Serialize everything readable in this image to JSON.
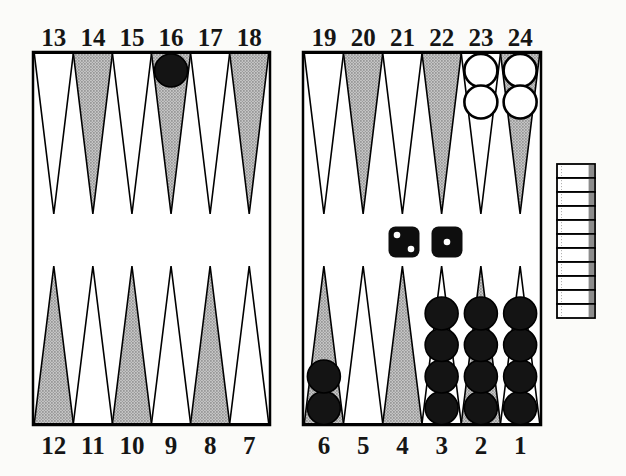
{
  "diagram": {
    "type": "backgammon-position"
  },
  "colors": {
    "background": "#fbfbf9",
    "board_fill": "#ffffff",
    "outline": "#000000",
    "point_shaded": "#bdbdbd",
    "point_shaded_dot": "#8a8a8a",
    "point_light": "#ffffff",
    "checker_dark": "#141414",
    "checker_light": "#ffffff",
    "die_body": "#0e0e0e",
    "die_pip": "#ffffff",
    "tray_fill": "#ffffff",
    "tray_shade": "#8c8c8c",
    "label": "#151515"
  },
  "points": [
    {
      "number": "13",
      "row": "top",
      "col": 0,
      "fill": "light",
      "checkers": null
    },
    {
      "number": "14",
      "row": "top",
      "col": 1,
      "fill": "shaded",
      "checkers": null
    },
    {
      "number": "15",
      "row": "top",
      "col": 2,
      "fill": "light",
      "checkers": null
    },
    {
      "number": "16",
      "row": "top",
      "col": 3,
      "fill": "shaded",
      "checkers": {
        "color": "black",
        "count": 1
      }
    },
    {
      "number": "17",
      "row": "top",
      "col": 4,
      "fill": "light",
      "checkers": null
    },
    {
      "number": "18",
      "row": "top",
      "col": 5,
      "fill": "shaded",
      "checkers": null
    },
    {
      "number": "19",
      "row": "top",
      "col": 6,
      "fill": "light",
      "checkers": null
    },
    {
      "number": "20",
      "row": "top",
      "col": 7,
      "fill": "shaded",
      "checkers": null
    },
    {
      "number": "21",
      "row": "top",
      "col": 8,
      "fill": "light",
      "checkers": null
    },
    {
      "number": "22",
      "row": "top",
      "col": 9,
      "fill": "shaded",
      "checkers": null
    },
    {
      "number": "23",
      "row": "top",
      "col": 10,
      "fill": "light",
      "checkers": {
        "color": "white",
        "count": 2
      }
    },
    {
      "number": "24",
      "row": "top",
      "col": 11,
      "fill": "shaded",
      "checkers": {
        "color": "white",
        "count": 2
      }
    },
    {
      "number": "12",
      "row": "bottom",
      "col": 0,
      "fill": "shaded",
      "checkers": null
    },
    {
      "number": "11",
      "row": "bottom",
      "col": 1,
      "fill": "light",
      "checkers": null
    },
    {
      "number": "10",
      "row": "bottom",
      "col": 2,
      "fill": "shaded",
      "checkers": null
    },
    {
      "number": "9",
      "row": "bottom",
      "col": 3,
      "fill": "light",
      "checkers": null
    },
    {
      "number": "8",
      "row": "bottom",
      "col": 4,
      "fill": "shaded",
      "checkers": null
    },
    {
      "number": "7",
      "row": "bottom",
      "col": 5,
      "fill": "light",
      "checkers": null
    },
    {
      "number": "6",
      "row": "bottom",
      "col": 6,
      "fill": "shaded",
      "checkers": {
        "color": "black",
        "count": 2
      }
    },
    {
      "number": "5",
      "row": "bottom",
      "col": 7,
      "fill": "light",
      "checkers": null
    },
    {
      "number": "4",
      "row": "bottom",
      "col": 8,
      "fill": "shaded",
      "checkers": null
    },
    {
      "number": "3",
      "row": "bottom",
      "col": 9,
      "fill": "light",
      "checkers": {
        "color": "black",
        "count": 4
      }
    },
    {
      "number": "2",
      "row": "bottom",
      "col": 10,
      "fill": "shaded",
      "checkers": {
        "color": "black",
        "count": 4
      }
    },
    {
      "number": "1",
      "row": "bottom",
      "col": 11,
      "fill": "light",
      "checkers": {
        "color": "black",
        "count": 4
      }
    }
  ],
  "dice": [
    {
      "position": "left",
      "value": 2
    },
    {
      "position": "right",
      "value": 1
    }
  ],
  "bear_off_tray": {
    "slat_count": 11,
    "checker_color": "white"
  }
}
